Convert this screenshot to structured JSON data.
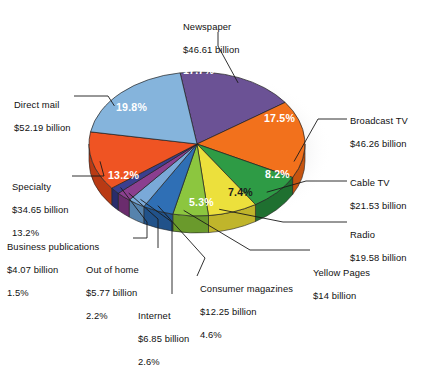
{
  "chart_data": {
    "type": "pie",
    "title": "",
    "subtitle": "",
    "xlabel": "",
    "ylabel": "",
    "legend_position": "callouts",
    "grid": false,
    "units": "billion US dollars",
    "value_prefix": "$",
    "categories": [
      "Newspaper",
      "Broadcast TV",
      "Cable TV",
      "Radio",
      "Yellow Pages",
      "Consumer magazines",
      "Internet",
      "Out of home",
      "Business publications",
      "Specialty",
      "Direct mail"
    ],
    "values": [
      46.61,
      46.26,
      21.53,
      19.58,
      14.0,
      12.25,
      6.85,
      5.77,
      4.07,
      34.65,
      52.19
    ],
    "percents": [
      17.7,
      17.5,
      8.2,
      7.4,
      5.3,
      4.6,
      2.6,
      2.2,
      1.5,
      13.2,
      19.8
    ],
    "colors": [
      "#6b5295",
      "#f2711c",
      "#2e9b45",
      "#ece03c",
      "#8cc63f",
      "#2f6fb5",
      "#7aa9d8",
      "#8b3f8f",
      "#3b3f8f",
      "#ef5423",
      "#85b4dc"
    ],
    "slices": [
      {
        "name": "Newspaper",
        "label": "Newspaper",
        "amount": "$46.61 billion",
        "value": 46.61,
        "percent": 17.7,
        "percent_label": "17.7%",
        "color": "#6b5295",
        "side_color": "#55406f",
        "label_color": "white",
        "show_percent_in_callout": false
      },
      {
        "name": "Broadcast TV",
        "label": "Broadcast TV",
        "amount": "$46.26 billion",
        "value": 46.26,
        "percent": 17.5,
        "percent_label": "17.5%",
        "color": "#f2711c",
        "side_color": "#c65410",
        "label_color": "white",
        "show_percent_in_callout": false
      },
      {
        "name": "Cable TV",
        "label": "Cable TV",
        "amount": "$21.53 billion",
        "value": 21.53,
        "percent": 8.2,
        "percent_label": "8.2%",
        "color": "#2e9b45",
        "side_color": "#1f7030",
        "label_color": "white",
        "show_percent_in_callout": false
      },
      {
        "name": "Radio",
        "label": "Radio",
        "amount": "$19.58 billion",
        "value": 19.58,
        "percent": 7.4,
        "percent_label": "7.4%",
        "color": "#ece03c",
        "side_color": "#c0b52b",
        "label_color": "dark",
        "show_percent_in_callout": false
      },
      {
        "name": "Yellow Pages",
        "label": "Yellow Pages",
        "amount": "$14 billion",
        "value": 14.0,
        "percent": 5.3,
        "percent_label": "5.3%",
        "color": "#8cc63f",
        "side_color": "#6a9a2c",
        "label_color": "white",
        "show_percent_in_callout": false
      },
      {
        "name": "Consumer magazines",
        "label": "Consumer magazines",
        "amount": "$12.25 billion",
        "value": 12.25,
        "percent": 4.6,
        "percent_label": "4.6%",
        "color": "#2f6fb5",
        "side_color": "#21528a",
        "label_color": "white",
        "show_percent_in_callout": true
      },
      {
        "name": "Internet",
        "label": "Internet",
        "amount": "$6.85 billion",
        "value": 6.85,
        "percent": 2.6,
        "percent_label": "2.6%",
        "color": "#7aa9d8",
        "side_color": "#5683ad",
        "label_color": "white",
        "show_percent_in_callout": true
      },
      {
        "name": "Out of home",
        "label": "Out of home",
        "amount": "$5.77 billion",
        "value": 5.77,
        "percent": 2.2,
        "percent_label": "2.2%",
        "color": "#8b3f8f",
        "side_color": "#6a2c6d",
        "label_color": "white",
        "show_percent_in_callout": true
      },
      {
        "name": "Business publications",
        "label": "Business publications",
        "amount": "$4.07 billion",
        "value": 4.07,
        "percent": 1.5,
        "percent_label": "1.5%",
        "color": "#3b3f8f",
        "side_color": "#2a2d6b",
        "label_color": "white",
        "show_percent_in_callout": true
      },
      {
        "name": "Specialty",
        "label": "Specialty",
        "amount": "$34.65 billion",
        "value": 34.65,
        "percent": 13.2,
        "percent_label": "13.2%",
        "color": "#ef5423",
        "side_color": "#b93a14",
        "label_color": "white",
        "show_percent_in_callout": true
      },
      {
        "name": "Direct mail",
        "label": "Direct mail",
        "amount": "$52.19 billion",
        "value": 52.19,
        "percent": 19.8,
        "percent_label": "19.8%",
        "color": "#85b4dc",
        "side_color": "#5e8cb5",
        "label_color": "white",
        "show_percent_in_callout": false
      }
    ]
  },
  "callouts": {
    "newspaper": {
      "line1": "Newspaper",
      "line2": "$46.61 billion",
      "line3": ""
    },
    "broadcast_tv": {
      "line1": "Broadcast TV",
      "line2": "$46.26 billion",
      "line3": ""
    },
    "cable_tv": {
      "line1": "Cable TV",
      "line2": "$21.53 billion",
      "line3": ""
    },
    "radio": {
      "line1": "Radio",
      "line2": "$19.58 billion",
      "line3": ""
    },
    "yellow_pages": {
      "line1": "Yellow Pages",
      "line2": "$14 billion",
      "line3": ""
    },
    "consumer_magazines": {
      "line1": "Consumer magazines",
      "line2": "$12.25 billion",
      "line3": "4.6%"
    },
    "internet": {
      "line1": "Internet",
      "line2": "$6.85 billion",
      "line3": "2.6%"
    },
    "out_of_home": {
      "line1": "Out of home",
      "line2": "$5.77 billion",
      "line3": "2.2%"
    },
    "business_publications": {
      "line1": "Business publications",
      "line2": "$4.07 billion",
      "line3": "1.5%"
    },
    "specialty": {
      "line1": "Specialty",
      "line2": "$34.65 billion",
      "line3": "13.2%"
    },
    "direct_mail": {
      "line1": "Direct mail",
      "line2": "$52.19 billion",
      "line3": ""
    }
  },
  "slice_labels": {
    "newspaper": "17.7%",
    "broadcast_tv": "17.5%",
    "cable_tv": "8.2%",
    "radio": "7.4%",
    "yellow_pages": "5.3%",
    "specialty": "13.2%",
    "direct_mail": "19.8%"
  }
}
